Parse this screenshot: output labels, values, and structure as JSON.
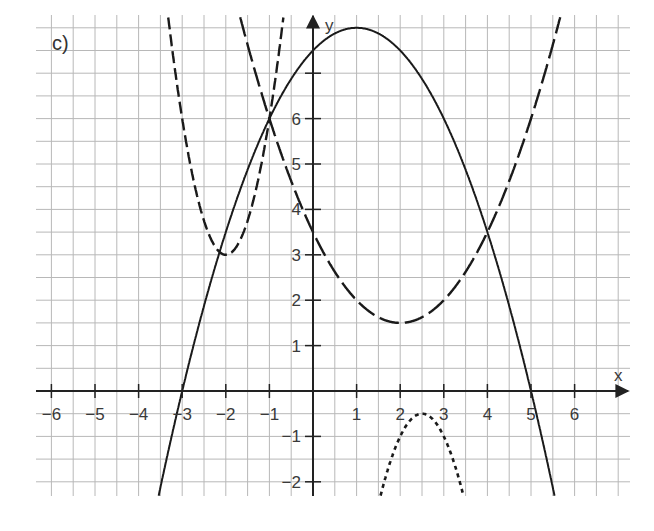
{
  "panel_label": "c)",
  "chart_data": {
    "type": "line",
    "title": "c)",
    "xlabel": "x",
    "ylabel": "y",
    "xlim": [
      -6.5,
      7
    ],
    "ylim": [
      -2.3,
      8.4
    ],
    "grid": true,
    "grid_step": 0.5,
    "x_ticks": [
      -6,
      -5,
      -4,
      -3,
      -2,
      -1,
      1,
      2,
      3,
      4,
      5,
      6
    ],
    "x_tick_labels": [
      "-6",
      "-5",
      "-4",
      "-3",
      "-2",
      "-1",
      "1",
      "2",
      "3",
      "4",
      "5",
      "6"
    ],
    "y_ticks": [
      -2,
      -1,
      1,
      2,
      3,
      4,
      5,
      6,
      7
    ],
    "y_tick_labels": [
      "-2",
      "-1",
      "1",
      "2",
      "3",
      "4",
      "5",
      "6",
      ""
    ],
    "series": [
      {
        "name": "solid parabola",
        "style": "solid",
        "equation": "y = -0.5(x-1)^2 + 8",
        "a": -0.5,
        "h": 1,
        "k": 8,
        "vertex": [
          1,
          8
        ],
        "points": [
          [
            -3,
            0
          ],
          [
            -2,
            3.5
          ],
          [
            -1,
            6
          ],
          [
            0,
            7.5
          ],
          [
            1,
            8
          ],
          [
            2,
            7.5
          ],
          [
            3,
            6
          ],
          [
            4,
            3.5
          ],
          [
            5,
            0
          ]
        ]
      },
      {
        "name": "long-dashed parabola",
        "style": "long-dash",
        "equation": "y = 0.5(x-2)^2 + 1.5",
        "a": 0.5,
        "h": 2,
        "k": 1.5,
        "vertex": [
          2,
          1.5
        ],
        "points": [
          [
            -1,
            6
          ],
          [
            0,
            3.5
          ],
          [
            1,
            2
          ],
          [
            2,
            1.5
          ],
          [
            3,
            2
          ],
          [
            4,
            3.5
          ],
          [
            5,
            6
          ]
        ]
      },
      {
        "name": "dashed narrow parabola",
        "style": "dash",
        "equation": "y = 3(x+2)^2 + 3",
        "a": 3,
        "h": -2,
        "k": 3,
        "vertex": [
          -2,
          3
        ],
        "points": [
          [
            -3,
            6
          ],
          [
            -2,
            3
          ],
          [
            -1,
            6
          ]
        ]
      },
      {
        "name": "dotted parabola",
        "style": "dotted",
        "equation": "y = -2(x-2.5)^2 - 0.5",
        "a": -2,
        "h": 2.5,
        "k": -0.5,
        "vertex": [
          2.5,
          -0.5
        ],
        "points": [
          [
            1.5,
            -2.5
          ],
          [
            2,
            -1
          ],
          [
            2.5,
            -0.5
          ],
          [
            3,
            -1
          ],
          [
            3.5,
            -2.5
          ]
        ]
      }
    ],
    "intersections": [
      [
        -1,
        6
      ],
      [
        4,
        3.5
      ],
      [
        -3,
        0
      ],
      [
        5,
        0
      ]
    ]
  }
}
